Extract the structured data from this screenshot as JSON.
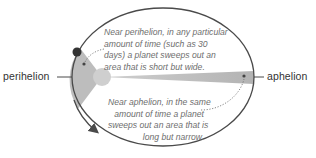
{
  "diagram": {
    "labels": {
      "perihelion": "perihelion",
      "aphelion": "aphelion"
    },
    "notes": {
      "perihelion_note": {
        "lines": [
          "Near perihelion, in any particular",
          "amount of time (such as 30",
          "days) a planet sweeps out an",
          "area that is short but wide."
        ]
      },
      "aphelion_note": {
        "lines": [
          "Near aphelion, in the same",
          "amount of time a planet",
          "sweeps out an area that is",
          "long but narrow."
        ]
      }
    },
    "elements": {
      "orbit": "elliptical orbit",
      "sun": "sun at focus",
      "planet": "planet near perihelion",
      "direction": "orbit direction arrow"
    },
    "colors": {
      "orbit_stroke": "#4a4a4a",
      "wedge_fill": "#bdbdbd",
      "sun_fill": "#cfcfcf",
      "planet_fill": "#333333",
      "text": "#6e6e6e",
      "label": "#333333"
    }
  }
}
